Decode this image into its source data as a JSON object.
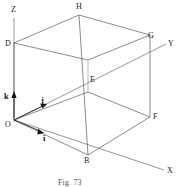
{
  "figure": {
    "caption": "Fig. 73",
    "caption_prefix": "Fig.",
    "caption_number": "73",
    "ink_color": "#5a5a5a",
    "label_color": "#1a1a1a",
    "background_color": "#ffffff"
  },
  "axes": [
    {
      "id": "x-axis",
      "label": "X",
      "label_x": 167,
      "label_y": 173
    },
    {
      "id": "y-axis",
      "label": "Y",
      "label_x": 168,
      "label_y": 46
    },
    {
      "id": "z-axis",
      "label": "Z",
      "label_x": 11,
      "label_y": 12
    }
  ],
  "vertices": [
    {
      "id": "origin",
      "label": "O",
      "label_x": 5,
      "label_y": 127
    },
    {
      "id": "vertex-b",
      "label": "B",
      "label_x": 84,
      "label_y": 163
    },
    {
      "id": "vertex-f",
      "label": "F",
      "label_x": 153,
      "label_y": 119
    },
    {
      "id": "vertex-e",
      "label": "E",
      "label_x": 90,
      "label_y": 82
    },
    {
      "id": "vertex-d",
      "label": "D",
      "label_x": 5,
      "label_y": 46
    },
    {
      "id": "vertex-h",
      "label": "H",
      "label_x": 76,
      "label_y": 9
    },
    {
      "id": "vertex-g",
      "label": "G",
      "label_x": 148,
      "label_y": 38
    }
  ],
  "unit_vectors": [
    {
      "id": "vector-i",
      "label": "i",
      "label_x": 43,
      "label_y": 141,
      "direction": "toward X axis"
    },
    {
      "id": "vector-j",
      "label": "j",
      "label_x": 41,
      "label_y": 103,
      "direction": "toward Y axis"
    },
    {
      "id": "vector-k",
      "label": "k",
      "label_x": 4,
      "label_y": 99,
      "direction": "toward Z axis"
    }
  ]
}
